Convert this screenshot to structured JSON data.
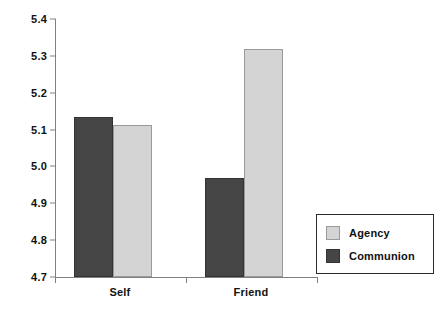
{
  "chart_data": {
    "type": "bar",
    "title": "",
    "subtitle": "",
    "xlabel": "",
    "ylabel": "",
    "categories": [
      "Self",
      "Friend"
    ],
    "series": [
      {
        "name": "Agency",
        "color": "#d4d4d4",
        "values": [
          5.112,
          5.32
        ]
      },
      {
        "name": "Communion",
        "color": "#454545",
        "values": [
          5.133,
          4.97
        ]
      }
    ],
    "bar_order_left_to_right": [
      "Communion",
      "Agency"
    ],
    "ylim": [
      4.7,
      5.4
    ],
    "ytick_step": 0.1,
    "yticks": [
      "5.4",
      "5.3",
      "5.2",
      "5.1",
      "5.0",
      "4.9",
      "4.8",
      "4.7"
    ],
    "ytick_values": [
      5.4,
      5.3,
      5.2,
      5.1,
      5.0,
      4.9,
      4.8,
      4.7
    ],
    "grid": false,
    "legend_position": "right-bottom",
    "legend_entries": [
      "Agency",
      "Communion"
    ],
    "axis_color": "#808080",
    "text_color": "#111111",
    "background": "#ffffff"
  },
  "yticks": {
    "t0": "5.4",
    "t1": "5.3",
    "t2": "5.2",
    "t3": "5.1",
    "t4": "5.0",
    "t5": "4.9",
    "t6": "4.8",
    "t7": "4.7"
  },
  "xlabels": {
    "g0": "Self",
    "g1": "Friend"
  },
  "legend": {
    "agency": "Agency",
    "communion": "Communion"
  }
}
